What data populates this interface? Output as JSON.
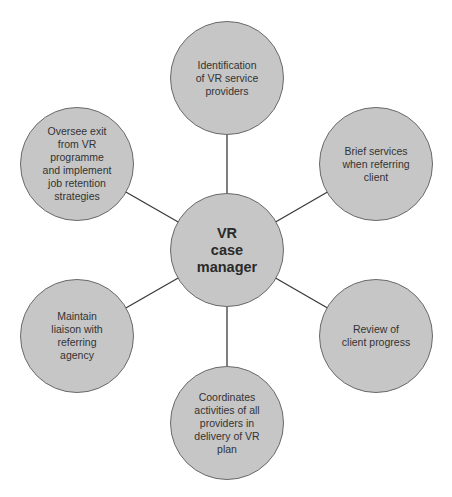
{
  "diagram": {
    "type": "hub-and-spoke",
    "center": {
      "id": "hub",
      "label": "VR\ncase\nmanager",
      "cx": 227,
      "cy": 250,
      "r": 57
    },
    "nodes": [
      {
        "id": "top",
        "label": "Identification\nof  VR service\nproviders",
        "cx": 227,
        "cy": 78,
        "r": 57
      },
      {
        "id": "upper-right",
        "label": "Brief services\nwhen referring\nclient",
        "cx": 376,
        "cy": 164,
        "r": 57
      },
      {
        "id": "lower-right",
        "label": "Review of\nclient progress",
        "cx": 376,
        "cy": 336,
        "r": 57
      },
      {
        "id": "bottom",
        "label": "Coordinates\nactivities of all\nproviders in\ndelivery of VR\nplan",
        "cx": 227,
        "cy": 423,
        "r": 57
      },
      {
        "id": "lower-left",
        "label": "Maintain\nliaison with\nreferring\nagency",
        "cx": 77,
        "cy": 336,
        "r": 57
      },
      {
        "id": "upper-left",
        "label": "Oversee exit\nfrom VR\nprogramme\nand implement\njob retention\nstrategies",
        "cx": 77,
        "cy": 164,
        "r": 57
      }
    ],
    "edges": [
      [
        "hub",
        "top"
      ],
      [
        "hub",
        "upper-right"
      ],
      [
        "hub",
        "lower-right"
      ],
      [
        "hub",
        "bottom"
      ],
      [
        "hub",
        "lower-left"
      ],
      [
        "hub",
        "upper-left"
      ]
    ],
    "colors": {
      "fill": "#c6c6c6",
      "stroke": "#6a6a6a",
      "line": "#3a3a3a"
    }
  }
}
